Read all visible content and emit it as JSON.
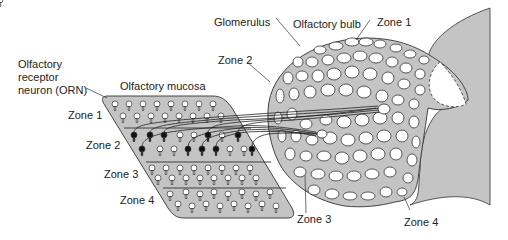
{
  "labels": {
    "orn": [
      "Olfactory",
      "receptor",
      "neuron (ORN)"
    ],
    "mucosa": "Olfactory mucosa",
    "glomerulus": "Glomerulus",
    "bulb": "Olfactory bulb",
    "bulb_zone1": "Zone 1",
    "bulb_zone2": "Zone 2",
    "bulb_zone3": "Zone 3",
    "bulb_zone4": "Zone 4",
    "mucosa_zones": [
      "Zone 1",
      "Zone 2",
      "Zone 3",
      "Zone 4"
    ]
  },
  "colors": {
    "tissue_fill": "#c4c4c4",
    "outline": "#333333",
    "glomerulus_fill": "#ffffff",
    "active_neuron": "#111111",
    "inactive_neuron": "#ffffff"
  }
}
